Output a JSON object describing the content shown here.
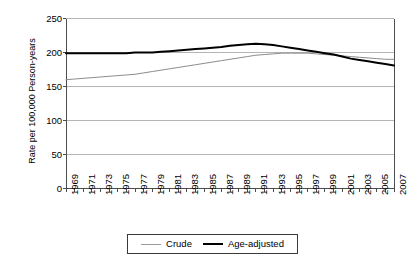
{
  "chart_data": {
    "type": "line",
    "title": "",
    "xlabel": "",
    "ylabel": "Rate per 100,000 Person-years",
    "ylim": [
      0,
      250
    ],
    "yticks": [
      0,
      50,
      100,
      150,
      200,
      250
    ],
    "grid": true,
    "legend_position": "bottom",
    "x": [
      1969,
      1970,
      1971,
      1972,
      1973,
      1974,
      1975,
      1976,
      1977,
      1978,
      1979,
      1980,
      1981,
      1982,
      1983,
      1984,
      1985,
      1986,
      1987,
      1988,
      1989,
      1990,
      1991,
      1992,
      1993,
      1994,
      1995,
      1996,
      1997,
      1998,
      1999,
      2000,
      2001,
      2002,
      2003,
      2004,
      2005,
      2006,
      2007
    ],
    "xticklabels": [
      "1969",
      "1971",
      "1973",
      "1975",
      "1977",
      "1979",
      "1981",
      "1983",
      "1985",
      "1987",
      "1989",
      "1991",
      "1993",
      "1995",
      "1997",
      "1999",
      "2001",
      "2003",
      "2005",
      "2007"
    ],
    "xtick_step": 2,
    "series": [
      {
        "name": "Crude",
        "color": "#8c8c8c",
        "width": 1,
        "values": [
          160,
          161,
          162,
          163,
          164,
          165,
          166,
          167,
          168,
          170,
          172,
          174,
          176,
          178,
          180,
          182,
          184,
          186,
          188,
          190,
          192,
          194,
          196,
          197,
          198,
          199,
          199,
          199,
          199,
          198,
          197,
          196,
          195,
          194,
          193,
          192,
          191,
          190,
          190
        ]
      },
      {
        "name": "Age-adjusted",
        "color": "#000000",
        "width": 2,
        "values": [
          199,
          199,
          199,
          199,
          199,
          199,
          199,
          199,
          200,
          200,
          200,
          201,
          202,
          203,
          204,
          205,
          206,
          207,
          208,
          210,
          211,
          212,
          213,
          212,
          211,
          209,
          207,
          205,
          203,
          201,
          199,
          197,
          194,
          191,
          189,
          187,
          185,
          183,
          181
        ]
      }
    ]
  },
  "legend": {
    "items": [
      {
        "label": "Crude"
      },
      {
        "label": "Age-adjusted"
      }
    ]
  },
  "colors": {
    "crude": "#8c8c8c",
    "age_adjusted": "#000000",
    "grid": "#b4b4b4",
    "axis": "#4d4d4d",
    "background": "#ffffff"
  }
}
